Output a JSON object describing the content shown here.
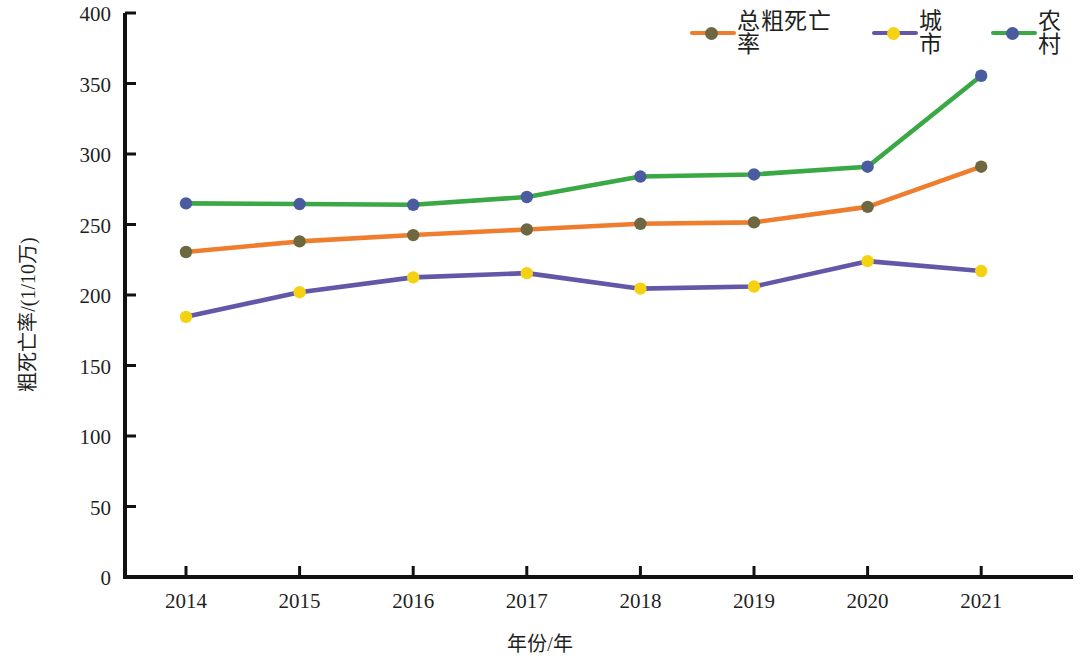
{
  "chart_data": {
    "type": "line",
    "title": "",
    "xlabel": "年份/年",
    "ylabel": "粗死亡率/(1/10万)",
    "categories": [
      "2014",
      "2015",
      "2016",
      "2017",
      "2018",
      "2019",
      "2020",
      "2021"
    ],
    "x": [
      2014,
      2015,
      2016,
      2017,
      2018,
      2019,
      2020,
      2021
    ],
    "xlim": [
      2013.5,
      2021.8
    ],
    "ylim": [
      0,
      400
    ],
    "yticks": [
      0,
      50,
      100,
      150,
      200,
      250,
      300,
      350,
      400
    ],
    "xticks": [
      "2014",
      "2015",
      "2016",
      "2017",
      "2018",
      "2019",
      "2020",
      "2021"
    ],
    "grid": false,
    "legend_position": "top-right",
    "series": [
      {
        "name": "总粗死亡率",
        "line_color": "#ef7d2e",
        "marker_color": "#6e6840",
        "values": [
          230.5,
          238.0,
          242.5,
          246.5,
          250.5,
          251.5,
          262.5,
          291.0
        ]
      },
      {
        "name": "城市",
        "line_color": "#6357a8",
        "marker_color": "#f5d211",
        "values": [
          184.5,
          202.0,
          212.5,
          215.5,
          204.5,
          206.0,
          224.0,
          217.0
        ]
      },
      {
        "name": "农村",
        "line_color": "#3aa845",
        "marker_color": "#4a5ba0",
        "values": [
          265.0,
          264.5,
          264.0,
          269.5,
          284.0,
          285.5,
          291.0,
          355.5
        ]
      }
    ]
  },
  "legend": {
    "items": [
      {
        "label": "总粗死亡率",
        "line_color": "#ef7d2e",
        "marker_color": "#6e6840"
      },
      {
        "label": "城市",
        "line_color": "#6357a8",
        "marker_color": "#f5d211"
      },
      {
        "label": "农村",
        "line_color": "#3aa845",
        "marker_color": "#4a5ba0"
      }
    ]
  },
  "axes": {
    "y_label": "粗死亡率/(1/10万)",
    "x_label": "年份/年",
    "axis_color": "#111111"
  }
}
